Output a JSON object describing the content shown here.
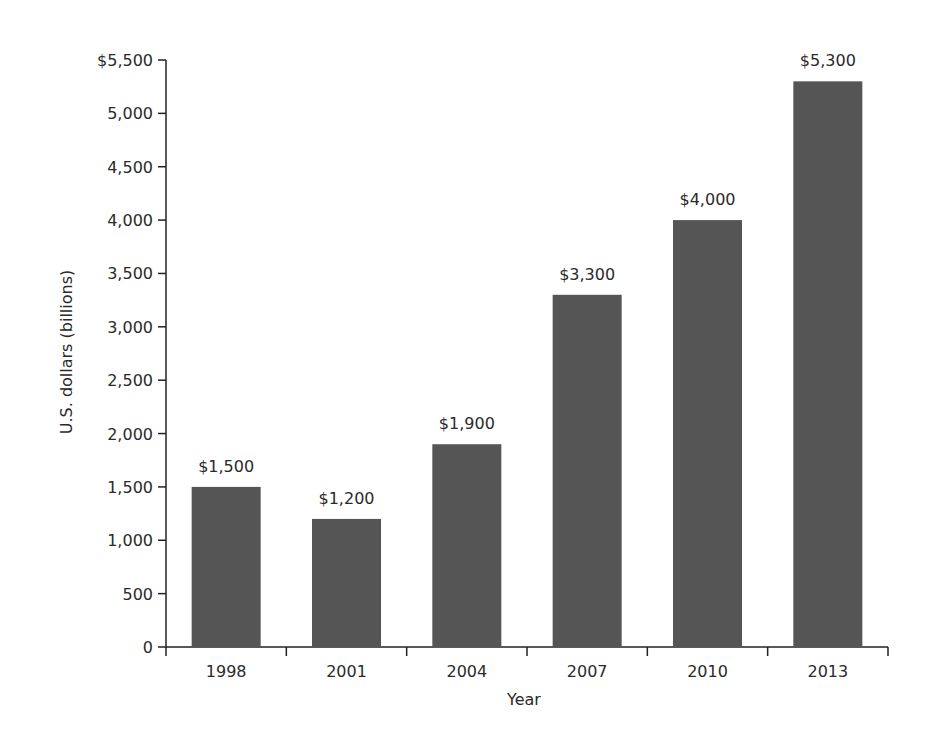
{
  "chart_data": {
    "type": "bar",
    "title": "",
    "xlabel": "Year",
    "ylabel": "U.S. dollars (billions)",
    "categories": [
      "1998",
      "2001",
      "2004",
      "2007",
      "2010",
      "2013"
    ],
    "values": [
      1500,
      1200,
      1900,
      3300,
      4000,
      5300
    ],
    "data_labels": [
      "$1,500",
      "$1,200",
      "$1,900",
      "$3,300",
      "$4,000",
      "$5,300"
    ],
    "ylim": [
      0,
      5500
    ],
    "yticks": [
      0,
      500,
      1000,
      1500,
      2000,
      2500,
      3000,
      3500,
      4000,
      4500,
      5000,
      5500
    ],
    "ytick_labels": [
      "0",
      "500",
      "1,000",
      "1,500",
      "2,000",
      "2,500",
      "3,000",
      "3,500",
      "4,000",
      "4,500",
      "5,000",
      "$5,500"
    ],
    "grid": false,
    "legend": null,
    "bar_color": "#555555"
  }
}
